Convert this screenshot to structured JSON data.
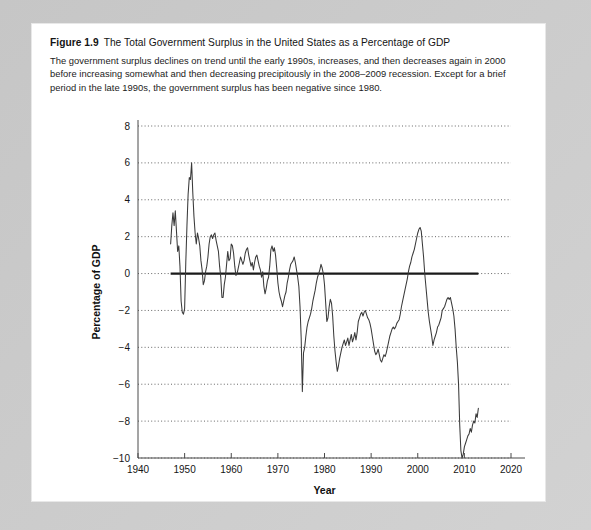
{
  "figure": {
    "number": "Figure 1.9",
    "title": "The Total Government Surplus in the United States as a Percentage of GDP",
    "description": "The government surplus declines on trend until the early 1990s, increases, and then decreases again in 2000 before increasing somewhat and then decreasing precipitously in the 2008–2009 recession. Except for a brief period in the late 1990s, the government surplus has been negative since 1980."
  },
  "colors": {
    "page_background": "#c9c9c9",
    "panel_background": "#ffffff",
    "data_line": "#3a3a3a",
    "zero_line": "#1a1a1a",
    "gridline": "#555555",
    "axis": "#4a4a4a",
    "text": "#141414"
  },
  "chart_data": {
    "type": "line",
    "title": "",
    "xlabel": "Year",
    "ylabel": "Percentage of GDP",
    "xlim": [
      1940,
      2020
    ],
    "ylim": [
      -10,
      8
    ],
    "xticks": [
      1940,
      1950,
      1960,
      1970,
      1980,
      1990,
      2000,
      2010,
      2020
    ],
    "yticks": [
      8,
      6,
      4,
      2,
      0,
      -2,
      -4,
      -6,
      -8,
      -10
    ],
    "xtick_labels": [
      "1940",
      "1950",
      "1960",
      "1970",
      "1980",
      "1990",
      "2000",
      "2010",
      "2020"
    ],
    "ytick_labels": [
      "8",
      "6",
      "4",
      "2",
      "0",
      "−2",
      "−4",
      "−6",
      "−8",
      "−10"
    ],
    "grid": "horizontal-dotted",
    "legend": "none",
    "reference_lines": [
      {
        "axis": "y",
        "value": 0,
        "style": "solid-thick"
      }
    ],
    "series": [
      {
        "name": "Total government surplus as percentage of GDP",
        "x": [
          1947.0,
          1947.25,
          1947.5,
          1947.75,
          1948.0,
          1948.25,
          1948.5,
          1948.75,
          1949.0,
          1949.25,
          1949.5,
          1949.75,
          1950.0,
          1950.25,
          1950.5,
          1950.75,
          1951.0,
          1951.25,
          1951.5,
          1951.75,
          1952.0,
          1952.25,
          1952.5,
          1952.75,
          1953.0,
          1953.25,
          1953.5,
          1953.75,
          1954.0,
          1954.25,
          1954.5,
          1954.75,
          1955.0,
          1955.25,
          1955.5,
          1955.75,
          1956.0,
          1956.25,
          1956.5,
          1956.75,
          1957.0,
          1957.25,
          1957.5,
          1957.75,
          1958.0,
          1958.25,
          1958.5,
          1958.75,
          1959.0,
          1959.25,
          1959.5,
          1959.75,
          1960.0,
          1960.25,
          1960.5,
          1960.75,
          1961.0,
          1961.25,
          1961.5,
          1961.75,
          1962.0,
          1962.25,
          1962.5,
          1962.75,
          1963.0,
          1963.25,
          1963.5,
          1963.75,
          1964.0,
          1964.25,
          1964.5,
          1964.75,
          1965.0,
          1965.25,
          1965.5,
          1965.75,
          1966.0,
          1966.25,
          1966.5,
          1966.75,
          1967.0,
          1967.25,
          1967.5,
          1967.75,
          1968.0,
          1968.25,
          1968.5,
          1968.75,
          1969.0,
          1969.25,
          1969.5,
          1969.75,
          1970.0,
          1970.25,
          1970.5,
          1970.75,
          1971.0,
          1971.25,
          1971.5,
          1971.75,
          1972.0,
          1972.25,
          1972.5,
          1972.75,
          1973.0,
          1973.25,
          1973.5,
          1973.75,
          1974.0,
          1974.25,
          1974.5,
          1974.75,
          1975.0,
          1975.25,
          1975.5,
          1975.75,
          1976.0,
          1976.25,
          1976.5,
          1976.75,
          1977.0,
          1977.25,
          1977.5,
          1977.75,
          1978.0,
          1978.25,
          1978.5,
          1978.75,
          1979.0,
          1979.25,
          1979.5,
          1979.75,
          1980.0,
          1980.25,
          1980.5,
          1980.75,
          1981.0,
          1981.25,
          1981.5,
          1981.75,
          1982.0,
          1982.25,
          1982.5,
          1982.75,
          1983.0,
          1983.25,
          1983.5,
          1983.75,
          1984.0,
          1984.25,
          1984.5,
          1984.75,
          1985.0,
          1985.25,
          1985.5,
          1985.75,
          1986.0,
          1986.25,
          1986.5,
          1986.75,
          1987.0,
          1987.25,
          1987.5,
          1987.75,
          1988.0,
          1988.25,
          1988.5,
          1988.75,
          1989.0,
          1989.25,
          1989.5,
          1989.75,
          1990.0,
          1990.25,
          1990.5,
          1990.75,
          1991.0,
          1991.25,
          1991.5,
          1991.75,
          1992.0,
          1992.25,
          1992.5,
          1992.75,
          1993.0,
          1993.25,
          1993.5,
          1993.75,
          1994.0,
          1994.25,
          1994.5,
          1994.75,
          1995.0,
          1995.25,
          1995.5,
          1995.75,
          1996.0,
          1996.25,
          1996.5,
          1996.75,
          1997.0,
          1997.25,
          1997.5,
          1997.75,
          1998.0,
          1998.25,
          1998.5,
          1998.75,
          1999.0,
          1999.25,
          1999.5,
          1999.75,
          2000.0,
          2000.25,
          2000.5,
          2000.75,
          2001.0,
          2001.25,
          2001.5,
          2001.75,
          2002.0,
          2002.25,
          2002.5,
          2002.75,
          2003.0,
          2003.25,
          2003.5,
          2003.75,
          2004.0,
          2004.25,
          2004.5,
          2004.75,
          2005.0,
          2005.25,
          2005.5,
          2005.75,
          2006.0,
          2006.25,
          2006.5,
          2006.75,
          2007.0,
          2007.25,
          2007.5,
          2007.75,
          2008.0,
          2008.25,
          2008.5,
          2008.75,
          2009.0,
          2009.25,
          2009.5,
          2009.75,
          2010.0,
          2010.25,
          2010.5,
          2010.75,
          2011.0,
          2011.25,
          2011.5,
          2011.75,
          2012.0,
          2012.25,
          2012.5,
          2012.75,
          2013.0
        ],
        "y": [
          1.6,
          2.6,
          3.3,
          2.6,
          3.4,
          2.3,
          1.2,
          1.5,
          0.4,
          -1.5,
          -2.1,
          -2.2,
          -1.9,
          0.6,
          2.6,
          4.3,
          5.2,
          5.1,
          6.0,
          4.4,
          3.1,
          2.2,
          1.6,
          2.2,
          1.9,
          1.5,
          0.7,
          0.2,
          -0.6,
          -0.4,
          0.1,
          0.4,
          0.9,
          1.6,
          2.0,
          2.1,
          1.9,
          2.1,
          2.2,
          1.8,
          1.5,
          1.2,
          0.4,
          -0.2,
          -1.3,
          -1.3,
          -0.6,
          -0.2,
          0.5,
          1.2,
          0.7,
          0.8,
          1.6,
          1.5,
          1.1,
          0.4,
          -0.1,
          0.0,
          0.3,
          0.6,
          0.9,
          0.7,
          0.5,
          0.7,
          1.1,
          1.3,
          1.4,
          1.0,
          0.7,
          0.4,
          0.6,
          0.2,
          0.6,
          0.9,
          1.0,
          0.7,
          0.4,
          0.2,
          -0.2,
          0.1,
          -0.7,
          -1.1,
          -0.8,
          -0.4,
          -0.2,
          0.4,
          1.3,
          1.5,
          1.2,
          1.4,
          1.0,
          0.3,
          -0.5,
          -1.0,
          -1.3,
          -1.5,
          -1.8,
          -1.5,
          -1.2,
          -1.0,
          -0.5,
          -0.2,
          0.2,
          0.5,
          0.6,
          0.7,
          0.9,
          0.6,
          0.2,
          -0.2,
          -0.7,
          -1.8,
          -3.5,
          -6.4,
          -4.3,
          -4.0,
          -3.4,
          -2.9,
          -2.6,
          -2.4,
          -2.2,
          -1.9,
          -1.5,
          -1.2,
          -0.9,
          -0.5,
          -0.2,
          0.0,
          0.2,
          0.5,
          0.3,
          0.0,
          -0.6,
          -1.6,
          -2.6,
          -2.4,
          -1.8,
          -1.4,
          -1.6,
          -2.3,
          -3.4,
          -4.2,
          -4.8,
          -5.3,
          -5.0,
          -4.6,
          -4.3,
          -4.0,
          -3.8,
          -3.6,
          -3.9,
          -3.7,
          -3.5,
          -3.9,
          -3.6,
          -3.3,
          -3.7,
          -3.5,
          -3.2,
          -3.6,
          -3.2,
          -2.6,
          -2.4,
          -2.2,
          -2.1,
          -2.3,
          -2.1,
          -2.0,
          -2.2,
          -2.4,
          -2.5,
          -2.7,
          -3.0,
          -3.4,
          -3.8,
          -4.2,
          -4.4,
          -4.3,
          -4.1,
          -4.4,
          -4.7,
          -4.8,
          -4.6,
          -4.4,
          -4.5,
          -4.3,
          -4.0,
          -3.7,
          -3.4,
          -3.2,
          -3.0,
          -2.9,
          -3.0,
          -2.9,
          -2.7,
          -2.6,
          -2.5,
          -2.2,
          -1.8,
          -1.5,
          -1.2,
          -0.9,
          -0.6,
          -0.3,
          0.1,
          0.4,
          0.6,
          0.9,
          1.1,
          1.3,
          1.6,
          1.9,
          2.2,
          2.4,
          2.5,
          2.3,
          1.6,
          0.9,
          0.0,
          -0.7,
          -1.4,
          -2.1,
          -2.6,
          -3.0,
          -3.4,
          -3.9,
          -3.6,
          -3.4,
          -3.2,
          -2.9,
          -2.8,
          -2.6,
          -2.4,
          -2.0,
          -1.9,
          -1.8,
          -1.6,
          -1.4,
          -1.3,
          -1.4,
          -1.3,
          -1.6,
          -1.9,
          -2.3,
          -3.0,
          -4.0,
          -4.8,
          -6.0,
          -8.2,
          -9.6,
          -10.0,
          -9.8,
          -9.4,
          -9.2,
          -9.0,
          -8.8,
          -8.7,
          -8.4,
          -8.6,
          -8.2,
          -8.0,
          -8.1,
          -7.6,
          -7.8,
          -7.3
        ]
      }
    ]
  }
}
